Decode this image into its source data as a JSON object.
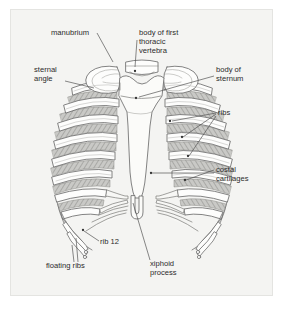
{
  "figure": {
    "panel_background": "#f4f4f2",
    "panel_border": "#e4e4e1",
    "page_background": "#ffffff",
    "bone_fill": "#fdfdfc",
    "bone_outline": "#6e6e6e",
    "cartilage_fill": "#f7f7f5",
    "intercostal_fill": "#c9c9c6",
    "hatch_color": "#8a8a87",
    "leader_color": "#555555",
    "label_color": "#2b2b2b"
  },
  "labels": [
    {
      "id": "manubrium",
      "text": "manubrium",
      "lines": [
        "manubrium"
      ],
      "text_x": 51,
      "text_y": 35,
      "anchor": "start",
      "leaders": [
        [
          [
            97,
            33
          ],
          [
            113,
            62
          ]
        ]
      ],
      "dots": []
    },
    {
      "id": "body-of-first-thoracic-vertebra",
      "text": "body of first thoracic vertebra",
      "lines": [
        "body of first",
        "thoracic",
        "vertebra"
      ],
      "text_x": 139,
      "text_y": 35,
      "anchor": "start",
      "leaders": [
        [
          [
            137,
            40
          ],
          [
            135,
            67
          ]
        ]
      ],
      "dots": [
        [
          135,
          71
        ]
      ]
    },
    {
      "id": "sternal-angle",
      "text": "sternal angle",
      "lines": [
        "sternal",
        "angle"
      ],
      "text_x": 34,
      "text_y": 72,
      "anchor": "start",
      "leaders": [
        [
          [
            65,
            81
          ],
          [
            94,
            88
          ]
        ]
      ],
      "dots": []
    },
    {
      "id": "body-of-sternum",
      "text": "body of sternum",
      "lines": [
        "body of",
        "sternum"
      ],
      "text_x": 216,
      "text_y": 72,
      "anchor": "start",
      "leaders": [
        [
          [
            214,
            76
          ],
          [
            139,
            97
          ]
        ]
      ],
      "dots": [
        [
          136,
          98
        ]
      ]
    },
    {
      "id": "ribs",
      "text": "ribs",
      "lines": [
        "ribs"
      ],
      "text_x": 218,
      "text_y": 115,
      "anchor": "start",
      "leaders": [
        [
          [
            216,
            113
          ],
          [
            172,
            121
          ]
        ],
        [
          [
            216,
            114
          ],
          [
            183,
            137
          ]
        ],
        [
          [
            216,
            116
          ],
          [
            189,
            156
          ]
        ]
      ],
      "dots": [
        [
          170,
          121
        ],
        [
          182,
          137
        ],
        [
          188,
          156
        ]
      ]
    },
    {
      "id": "costal-cartilages",
      "text": "costal cartilages",
      "lines": [
        "costal",
        "cartilages"
      ],
      "text_x": 216,
      "text_y": 172,
      "anchor": "start",
      "leaders": [
        [
          [
            214,
            170
          ],
          [
            186,
            180
          ]
        ],
        [
          [
            214,
            173
          ],
          [
            152,
            173
          ]
        ]
      ],
      "dots": [
        [
          185,
          180
        ],
        [
          151,
          173
        ]
      ]
    },
    {
      "id": "rib-12",
      "text": "rib 12",
      "lines": [
        "rib 12"
      ],
      "text_x": 100,
      "text_y": 244,
      "anchor": "start",
      "leaders": [
        [
          [
            99,
            241
          ],
          [
            84,
            231
          ]
        ]
      ],
      "dots": [
        [
          83,
          230
        ]
      ]
    },
    {
      "id": "floating-ribs",
      "text": "floating ribs",
      "lines": [
        "floating ribs"
      ],
      "text_x": 46,
      "text_y": 268,
      "anchor": "start",
      "leaders": [
        [
          [
            74,
            262
          ],
          [
            72,
            245
          ]
        ],
        [
          [
            78,
            262
          ],
          [
            76,
            238
          ]
        ]
      ],
      "dots": []
    },
    {
      "id": "xiphoid-process",
      "text": "xiphoid process",
      "lines": [
        "xiphoid",
        "process"
      ],
      "text_x": 150,
      "text_y": 266,
      "anchor": "start",
      "leaders": [
        [
          [
            150,
            260
          ],
          [
            133,
            203
          ]
        ]
      ],
      "dots": []
    }
  ]
}
